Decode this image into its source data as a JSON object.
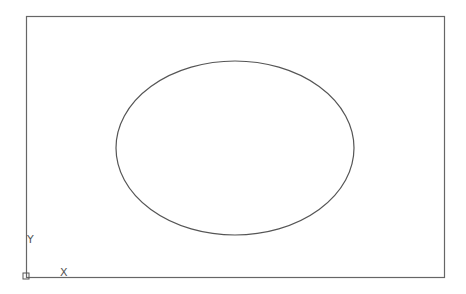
{
  "canvas": {
    "background": "#ffffff",
    "line_color": "#555555"
  },
  "drawing": {
    "border": {
      "x": 26,
      "y": 16,
      "width": 418,
      "height": 261
    },
    "ellipse": {
      "cx": 235,
      "cy": 148,
      "rx": 119,
      "ry": 87
    }
  },
  "ucs_icon": {
    "origin": {
      "x": 26,
      "y": 276
    },
    "x_label": "X",
    "y_label": "Y"
  }
}
